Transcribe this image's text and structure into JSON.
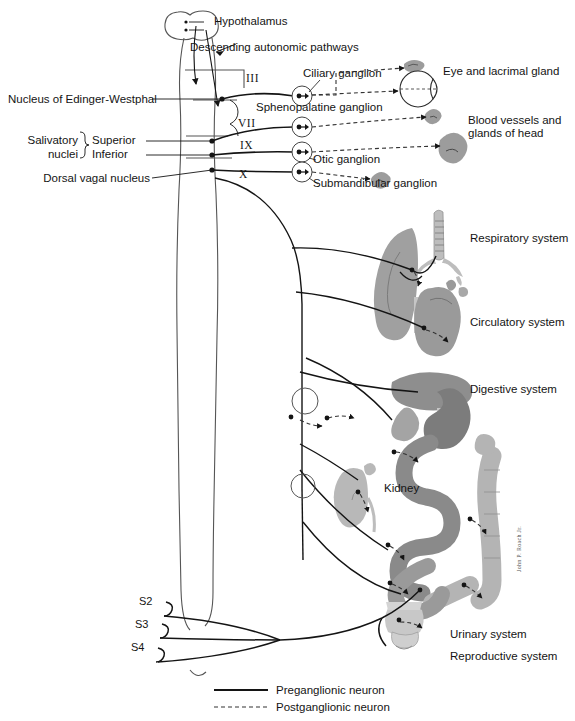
{
  "figure": {
    "background": "#ffffff",
    "ink": "#141414"
  },
  "cns_labels": {
    "hypothalamus": "Hypothalamus",
    "descending_pathways": "Descending autonomic pathways",
    "edinger_westphal": "Nucleus of Edinger-Westphal",
    "salivatory": "Salivatory",
    "nuclei": "nuclei",
    "superior": "Superior",
    "inferior": "Inferior",
    "dorsal_vagal": "Dorsal vagal nucleus"
  },
  "cranial_nerves": [
    {
      "numeral": "III",
      "x": 246,
      "y": 79
    },
    {
      "numeral": "VII",
      "x": 238,
      "y": 124
    },
    {
      "numeral": "IX",
      "x": 240,
      "y": 146
    },
    {
      "numeral": "X",
      "x": 239,
      "y": 175
    }
  ],
  "ganglia": [
    {
      "name": "Ciliary ganglion",
      "label_x": 303,
      "label_y": 73,
      "node_x": 302,
      "node_y": 96
    },
    {
      "name": "Sphenopalatine ganglion",
      "label_x": 258,
      "label_y": 106,
      "node_x": 302,
      "node_y": 127
    },
    {
      "name": "Otic ganglion",
      "label_x": 313,
      "label_y": 158,
      "node_x": 302,
      "node_y": 152
    },
    {
      "name": "Submandibular ganglion",
      "label_x": 313,
      "label_y": 182,
      "node_x": 302,
      "node_y": 172
    }
  ],
  "sacral_roots": [
    {
      "label": "S2",
      "x": 157,
      "y": 600
    },
    {
      "label": "S3",
      "x": 152,
      "y": 623
    },
    {
      "label": "S4",
      "x": 148,
      "y": 645
    }
  ],
  "target_organs": [
    {
      "label": "Eye and lacrimal gland",
      "x": 443,
      "y": 71
    },
    {
      "label": "Blood vessels and",
      "x": 468,
      "y": 119
    },
    {
      "label": "glands of head",
      "x": 468,
      "y": 132
    },
    {
      "label": "Respiratory system",
      "x": 470,
      "y": 238
    },
    {
      "label": "Circulatory system",
      "x": 470,
      "y": 322
    },
    {
      "label": "Digestive system",
      "x": 470,
      "y": 389
    },
    {
      "label": "Kidney",
      "x": 384,
      "y": 487
    },
    {
      "label": "Urinary system",
      "x": 450,
      "y": 634
    },
    {
      "label": "Reproductive system",
      "x": 450,
      "y": 656
    }
  ],
  "legend": {
    "items": [
      {
        "label": "Preganglionic neuron",
        "style": "solid"
      },
      {
        "label": "Postganglionic neuron",
        "style": "dashed"
      }
    ]
  },
  "signature": "John P. Roach Jr.",
  "organ_colors": {
    "lung": "#a0a0a0",
    "trachea": "#bdbdbd",
    "heart": "#9a9a9a",
    "liver": "#8e8e8e",
    "stomach": "#7c7c7c",
    "intestine": "#8a8a8a",
    "colon": "#b4b4b4",
    "kidney": "#b8b8b8",
    "bladder": "#c8c8c8",
    "gland": "#9c9c9c"
  }
}
